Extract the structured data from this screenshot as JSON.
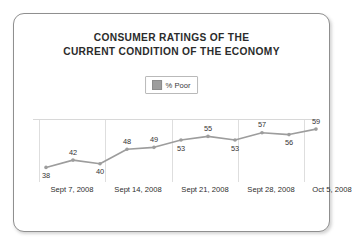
{
  "chart_data": {
    "type": "line",
    "title": "CONSUMER RATINGS OF THE CURRENT CONDITION OF THE ECONOMY",
    "title_lines": [
      "CONSUMER RATINGS OF THE",
      "CURRENT CONDITION OF THE ECONOMY"
    ],
    "xlabel": "",
    "ylabel": "",
    "grid": "vertical-only",
    "legend_position": "top-center",
    "legend": [
      "% Poor"
    ],
    "series": [
      {
        "name": "% Poor",
        "color": "#9d9d9d",
        "values": [
          38,
          42,
          40,
          48,
          49,
          53,
          55,
          53,
          57,
          56,
          59
        ],
        "labels": [
          "38",
          "42",
          "40",
          "48",
          "49",
          "53",
          "55",
          "53",
          "57",
          "56",
          "59"
        ],
        "label_positions": [
          "below",
          "above",
          "below",
          "above",
          "above",
          "below",
          "above",
          "below",
          "above",
          "below",
          "above"
        ]
      }
    ],
    "x_tick_labels": [
      "Sept 7, 2008",
      "Sept 14, 2008",
      "Sept 21, 2008",
      "Sept 28, 2008",
      "Oct 5, 2008"
    ],
    "ylim": [
      30,
      64
    ],
    "point_count": 11,
    "gridline_count": 5
  },
  "chart": {
    "title_line_1": "CONSUMER RATINGS OF THE",
    "title_line_2": "CURRENT CONDITION OF THE ECONOMY",
    "legend_label": "% Poor",
    "colors": {
      "line": "#9d9d9d",
      "marker": "#9d9d9d",
      "gridline": "#dedede",
      "card_border": "#8f8f8f",
      "text": "#2b2b2b"
    }
  }
}
